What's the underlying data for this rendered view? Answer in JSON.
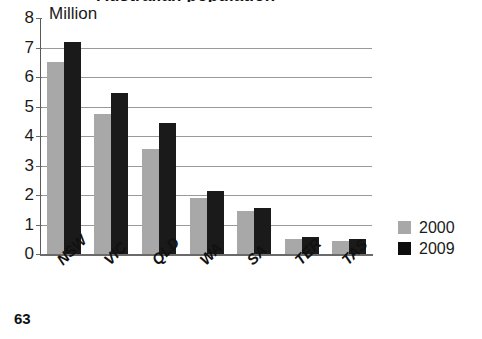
{
  "page": {
    "number": "63"
  },
  "chart_data": {
    "type": "bar",
    "title": "Australian population",
    "unit_label": "Million",
    "xlabel": "",
    "ylabel": "Million",
    "ylim": [
      0,
      8
    ],
    "yticks": [
      0,
      1,
      2,
      3,
      4,
      5,
      6,
      7,
      8
    ],
    "ytick_labels": [
      "0",
      "1",
      "2",
      "3",
      "4",
      "5",
      "6",
      "7",
      "8"
    ],
    "grid": true,
    "legend_position": "right",
    "categories": [
      "NSW",
      "VIC",
      "QLD",
      "WA",
      "SA",
      "TER",
      "TAS"
    ],
    "series": [
      {
        "name": "2000",
        "color": "#a8a8a8",
        "values": [
          6.5,
          4.75,
          3.55,
          1.9,
          1.45,
          0.5,
          0.45
        ]
      },
      {
        "name": "2009",
        "color": "#1a1a1a",
        "values": [
          7.2,
          5.45,
          4.45,
          2.15,
          1.55,
          0.58,
          0.5
        ]
      }
    ]
  },
  "legend": {
    "items": [
      {
        "label": "2000",
        "color": "#a8a8a8"
      },
      {
        "label": "2009",
        "color": "#0d0d0d"
      }
    ]
  }
}
